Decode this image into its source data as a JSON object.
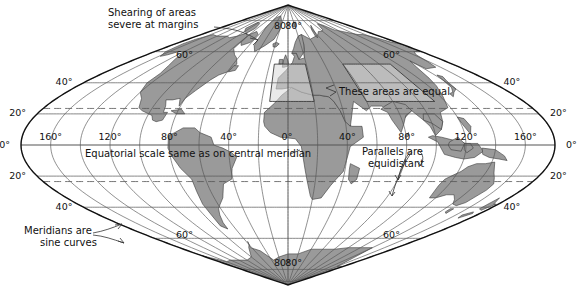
{
  "figure": {
    "projection_name": "Sinusoidal",
    "width": 580,
    "height": 291
  },
  "colors": {
    "background": "#ffffff",
    "land_fill": "#9a9a9a",
    "land_fill_light": "#c9c9c9",
    "highlight_fill": "#d8d8d8",
    "graticule": "#555555",
    "graticule_dashed": "#555555",
    "outline": "#111111",
    "text": "#111111",
    "leader": "#333333"
  },
  "graticule": {
    "parallel_interval_deg": 20,
    "meridian_interval_deg": 20,
    "labeled_parallels": [
      20,
      40,
      60,
      80
    ],
    "labeled_meridians": [
      0,
      40,
      80,
      120,
      160
    ],
    "dashed_parallels": [
      23.5,
      -23.5
    ],
    "central_meridian_deg": 0,
    "equator_label": "0°"
  },
  "latitude_labels": {
    "left_column": [
      {
        "text": "40°",
        "hemisphere": "north"
      },
      {
        "text": "20°",
        "hemisphere": "north"
      },
      {
        "text": "0°",
        "hemisphere": "equator"
      },
      {
        "text": "20°",
        "hemisphere": "south"
      },
      {
        "text": "40°",
        "hemisphere": "south"
      },
      {
        "text": "60°",
        "hemisphere": "south"
      }
    ],
    "right_column": [
      {
        "text": "40°",
        "hemisphere": "north"
      },
      {
        "text": "20°",
        "hemisphere": "north"
      },
      {
        "text": "0°",
        "hemisphere": "equator"
      },
      {
        "text": "20°",
        "hemisphere": "south"
      },
      {
        "text": "40°",
        "hemisphere": "south"
      },
      {
        "text": "60°",
        "hemisphere": "south"
      }
    ],
    "inner_north": [
      "80°",
      "60°",
      "80°",
      "60°"
    ],
    "inner_south": [
      "80°",
      "60°",
      "80°",
      "60°"
    ]
  },
  "tick_labels": {
    "top_left_80": "80°",
    "top_right_80": "80°",
    "upper_left_60": "60°",
    "upper_right_60": "60°",
    "upper_left_40": "40°",
    "upper_right_40": "40°",
    "upper_left_20": "20°",
    "upper_right_20": "20°",
    "left_0": "0°",
    "right_0": "0°",
    "lower_left_20": "20°",
    "lower_right_20": "20°",
    "lower_left_40": "40°",
    "lower_right_40": "40°",
    "lower_left_60": "60°",
    "lower_right_60": "60°",
    "bottom_left_80": "80°",
    "bottom_right_80": "80°"
  },
  "equator_meridian_labels": {
    "left_side": [
      "160°",
      "120°",
      "80°",
      "40°"
    ],
    "center": "0°",
    "right_side": [
      "40°",
      "80°",
      "120°",
      "160°"
    ]
  },
  "annotations": [
    {
      "id": "shearing",
      "line1": "Shearing of areas",
      "line2": "severe at margins",
      "x": 108,
      "y": 13,
      "anchor": "start",
      "leader": true
    },
    {
      "id": "equal-areas",
      "line1": "These areas are equal",
      "line2": "",
      "x": 339,
      "y": 92,
      "anchor": "start",
      "leader": true
    },
    {
      "id": "equatorial-scale",
      "line1": "Equatorial scale same as on central meridian",
      "line2": "",
      "x": 85,
      "y": 154,
      "anchor": "start",
      "leader": true
    },
    {
      "id": "parallels-equidistant",
      "line1": "Parallels are",
      "line2": "equidistant",
      "x": 362,
      "y": 152,
      "anchor": "start",
      "leader": true
    },
    {
      "id": "meridians-sine",
      "line1": "Meridians are",
      "line2": "sine curves",
      "x": 24,
      "y": 231,
      "anchor": "start",
      "leader": true
    }
  ],
  "chart_data": {
    "type": "map",
    "projection": "sinusoidal",
    "x_center_px": 288,
    "y_center_px": 145,
    "half_width_px": 267,
    "half_height_px": 140,
    "lat_range": [
      -90,
      90
    ],
    "lon_range": [
      -180,
      180
    ],
    "parallels_deg": [
      -80,
      -60,
      -40,
      -20,
      0,
      20,
      40,
      60,
      80
    ],
    "meridians_deg": [
      -180,
      -160,
      -140,
      -120,
      -100,
      -80,
      -60,
      -40,
      -20,
      0,
      20,
      40,
      60,
      80,
      100,
      120,
      140,
      160,
      180
    ],
    "tropics_deg": [
      23.5,
      -23.5
    ],
    "grid": true,
    "legend": "none",
    "highlight_boxes": [
      {
        "name": "equal-area-box-left",
        "lon0": -15,
        "lon1": 20,
        "lat0": 28,
        "lat1": 52
      },
      {
        "name": "equal-area-box-right",
        "lon0": 60,
        "lon1": 112,
        "lat0": 28,
        "lat1": 52
      }
    ]
  }
}
